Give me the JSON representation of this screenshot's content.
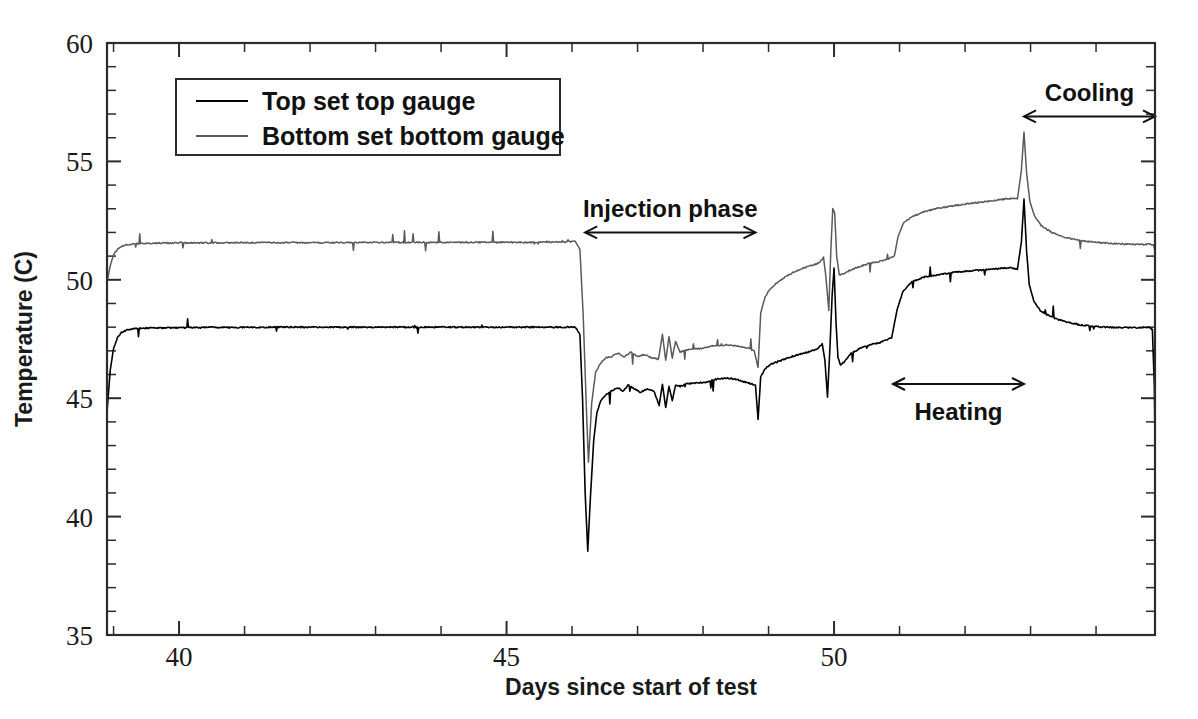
{
  "chart_data": {
    "type": "line",
    "title": "",
    "xlabel": "Days since start of test",
    "ylabel": "Temperature (C)",
    "xlim": [
      38.9,
      54.9
    ],
    "ylim": [
      35,
      60
    ],
    "x_major_ticks": [
      40,
      45,
      50
    ],
    "x_tick_labels": [
      "40",
      "45",
      "50"
    ],
    "x_minor_step": 1,
    "y_major_ticks": [
      35,
      40,
      45,
      50,
      55,
      60
    ],
    "y_tick_labels": [
      "35",
      "40",
      "45",
      "50",
      "55",
      "60"
    ],
    "y_minor_step": 1,
    "grid": false,
    "legend_position": "upper-left-inside",
    "series": [
      {
        "name": "Top set top gauge",
        "color": "#000000",
        "points": [
          [
            38.9,
            44.4
          ],
          [
            38.95,
            46.2
          ],
          [
            39.0,
            47.1
          ],
          [
            39.06,
            47.55
          ],
          [
            39.12,
            47.78
          ],
          [
            39.2,
            47.88
          ],
          [
            39.3,
            47.93
          ],
          [
            39.45,
            47.96
          ],
          [
            39.7,
            47.97
          ],
          [
            40.0,
            47.98
          ],
          [
            40.5,
            47.99
          ],
          [
            41.0,
            47.99
          ],
          [
            41.5,
            48.0
          ],
          [
            42.0,
            48.0
          ],
          [
            42.6,
            48.0
          ],
          [
            43.2,
            48.0
          ],
          [
            43.9,
            48.0
          ],
          [
            44.6,
            48.0
          ],
          [
            45.3,
            48.0
          ],
          [
            45.9,
            48.0
          ],
          [
            46.05,
            48.0
          ],
          [
            46.12,
            47.7
          ],
          [
            46.16,
            45.0
          ],
          [
            46.2,
            41.0
          ],
          [
            46.24,
            38.55
          ],
          [
            46.28,
            40.8
          ],
          [
            46.33,
            43.2
          ],
          [
            46.38,
            44.4
          ],
          [
            46.44,
            44.9
          ],
          [
            46.52,
            45.15
          ],
          [
            46.6,
            45.3
          ],
          [
            46.7,
            45.45
          ],
          [
            46.78,
            45.3
          ],
          [
            46.86,
            45.55
          ],
          [
            46.95,
            45.4
          ],
          [
            47.05,
            45.25
          ],
          [
            47.15,
            45.4
          ],
          [
            47.25,
            45.3
          ],
          [
            47.33,
            44.7
          ],
          [
            47.38,
            45.6
          ],
          [
            47.43,
            44.6
          ],
          [
            47.48,
            45.5
          ],
          [
            47.53,
            44.9
          ],
          [
            47.58,
            45.55
          ],
          [
            47.65,
            45.5
          ],
          [
            47.75,
            45.6
          ],
          [
            47.9,
            45.65
          ],
          [
            48.05,
            45.68
          ],
          [
            48.2,
            45.8
          ],
          [
            48.35,
            45.85
          ],
          [
            48.5,
            45.8
          ],
          [
            48.62,
            45.7
          ],
          [
            48.72,
            45.62
          ],
          [
            48.8,
            45.55
          ],
          [
            48.84,
            44.1
          ],
          [
            48.88,
            45.9
          ],
          [
            48.95,
            46.25
          ],
          [
            49.05,
            46.45
          ],
          [
            49.2,
            46.6
          ],
          [
            49.4,
            46.8
          ],
          [
            49.6,
            46.95
          ],
          [
            49.75,
            47.1
          ],
          [
            49.82,
            47.3
          ],
          [
            49.86,
            46.6
          ],
          [
            49.9,
            45.05
          ],
          [
            49.94,
            47.3
          ],
          [
            49.97,
            49.3
          ],
          [
            50.0,
            50.5
          ],
          [
            50.03,
            48.2
          ],
          [
            50.06,
            46.7
          ],
          [
            50.1,
            46.4
          ],
          [
            50.16,
            46.55
          ],
          [
            50.26,
            46.9
          ],
          [
            50.4,
            47.1
          ],
          [
            50.55,
            47.25
          ],
          [
            50.7,
            47.35
          ],
          [
            50.8,
            47.45
          ],
          [
            50.88,
            47.55
          ],
          [
            50.96,
            48.7
          ],
          [
            51.05,
            49.5
          ],
          [
            51.18,
            49.9
          ],
          [
            51.35,
            50.1
          ],
          [
            51.55,
            50.2
          ],
          [
            51.8,
            50.3
          ],
          [
            52.05,
            50.38
          ],
          [
            52.3,
            50.42
          ],
          [
            52.55,
            50.48
          ],
          [
            52.7,
            50.5
          ],
          [
            52.8,
            50.45
          ],
          [
            52.86,
            51.6
          ],
          [
            52.9,
            53.4
          ],
          [
            52.94,
            51.2
          ],
          [
            52.98,
            49.8
          ],
          [
            53.05,
            49.1
          ],
          [
            53.15,
            48.7
          ],
          [
            53.3,
            48.45
          ],
          [
            53.5,
            48.25
          ],
          [
            53.75,
            48.1
          ],
          [
            54.0,
            48.02
          ],
          [
            54.3,
            47.98
          ],
          [
            54.6,
            47.98
          ],
          [
            54.8,
            48.0
          ],
          [
            54.86,
            47.9
          ],
          [
            54.89,
            45.5
          ],
          [
            54.9,
            43.2
          ]
        ]
      },
      {
        "name": "Bottom set bottom gauge",
        "color": "#5a5a5a",
        "points": [
          [
            38.9,
            49.9
          ],
          [
            38.95,
            50.6
          ],
          [
            39.0,
            51.05
          ],
          [
            39.06,
            51.3
          ],
          [
            39.14,
            51.44
          ],
          [
            39.24,
            51.5
          ],
          [
            39.4,
            51.53
          ],
          [
            39.65,
            51.55
          ],
          [
            40.0,
            51.56
          ],
          [
            40.5,
            51.56
          ],
          [
            41.0,
            51.57
          ],
          [
            41.6,
            51.57
          ],
          [
            42.3,
            51.57
          ],
          [
            43.0,
            51.58
          ],
          [
            43.8,
            51.58
          ],
          [
            44.6,
            51.58
          ],
          [
            45.4,
            51.58
          ],
          [
            45.9,
            51.6
          ],
          [
            46.05,
            51.62
          ],
          [
            46.12,
            51.3
          ],
          [
            46.17,
            48.5
          ],
          [
            46.22,
            44.5
          ],
          [
            46.25,
            42.3
          ],
          [
            46.3,
            44.8
          ],
          [
            46.36,
            46.1
          ],
          [
            46.44,
            46.5
          ],
          [
            46.52,
            46.7
          ],
          [
            46.6,
            46.75
          ],
          [
            46.7,
            46.9
          ],
          [
            46.8,
            46.75
          ],
          [
            46.9,
            46.95
          ],
          [
            47.0,
            46.75
          ],
          [
            47.1,
            46.85
          ],
          [
            47.22,
            46.7
          ],
          [
            47.32,
            46.65
          ],
          [
            47.38,
            47.7
          ],
          [
            47.43,
            46.6
          ],
          [
            47.48,
            47.6
          ],
          [
            47.53,
            46.7
          ],
          [
            47.58,
            47.4
          ],
          [
            47.65,
            46.95
          ],
          [
            47.78,
            47.05
          ],
          [
            47.95,
            47.1
          ],
          [
            48.15,
            47.2
          ],
          [
            48.35,
            47.25
          ],
          [
            48.52,
            47.22
          ],
          [
            48.68,
            47.12
          ],
          [
            48.78,
            47.0
          ],
          [
            48.84,
            46.3
          ],
          [
            48.88,
            48.6
          ],
          [
            48.95,
            49.3
          ],
          [
            49.02,
            49.6
          ],
          [
            49.14,
            49.9
          ],
          [
            49.3,
            50.2
          ],
          [
            49.48,
            50.45
          ],
          [
            49.65,
            50.6
          ],
          [
            49.78,
            50.72
          ],
          [
            49.84,
            50.95
          ],
          [
            49.88,
            50.0
          ],
          [
            49.92,
            48.7
          ],
          [
            49.95,
            51.2
          ],
          [
            49.98,
            53.0
          ],
          [
            50.01,
            52.8
          ],
          [
            50.04,
            51.0
          ],
          [
            50.08,
            50.2
          ],
          [
            50.14,
            50.25
          ],
          [
            50.24,
            50.4
          ],
          [
            50.38,
            50.55
          ],
          [
            50.55,
            50.7
          ],
          [
            50.72,
            50.8
          ],
          [
            50.84,
            50.9
          ],
          [
            50.92,
            51.0
          ],
          [
            50.98,
            51.85
          ],
          [
            51.06,
            52.4
          ],
          [
            51.18,
            52.65
          ],
          [
            51.35,
            52.85
          ],
          [
            51.55,
            53.0
          ],
          [
            51.8,
            53.12
          ],
          [
            52.05,
            53.22
          ],
          [
            52.32,
            53.3
          ],
          [
            52.58,
            53.4
          ],
          [
            52.72,
            53.45
          ],
          [
            52.8,
            53.42
          ],
          [
            52.86,
            54.6
          ],
          [
            52.9,
            56.25
          ],
          [
            52.94,
            54.5
          ],
          [
            52.99,
            53.3
          ],
          [
            53.06,
            52.7
          ],
          [
            53.16,
            52.3
          ],
          [
            53.32,
            52.0
          ],
          [
            53.52,
            51.8
          ],
          [
            53.76,
            51.65
          ],
          [
            54.02,
            51.58
          ],
          [
            54.3,
            51.52
          ],
          [
            54.6,
            51.5
          ],
          [
            54.82,
            51.5
          ],
          [
            54.88,
            51.45
          ],
          [
            54.9,
            51.2
          ]
        ]
      }
    ],
    "annotations": [
      {
        "label": "Injection phase",
        "x_start": 46.2,
        "x_end": 48.8,
        "label_y": 53.0,
        "arrow_y": 52.0
      },
      {
        "label": "Heating",
        "x_start": 50.9,
        "x_end": 52.9,
        "label_y": 44.4,
        "arrow_y": 45.6
      },
      {
        "label": "Cooling",
        "x_start": 52.9,
        "x_end": 54.9,
        "label_y": 57.9,
        "arrow_y": 56.9
      }
    ]
  },
  "legend": {
    "entries": [
      {
        "label": "Top set top gauge",
        "color": "#000000"
      },
      {
        "label": "Bottom set bottom gauge",
        "color": "#5a5a5a"
      }
    ]
  }
}
